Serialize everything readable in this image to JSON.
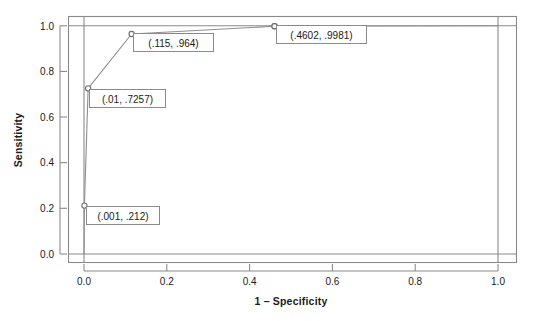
{
  "chart_data": {
    "type": "line",
    "title": "",
    "xlabel": "1 – Specificity",
    "ylabel": "Sensitivity",
    "xlim": [
      -0.045,
      1.045
    ],
    "ylim": [
      -0.04,
      1.06
    ],
    "grid": false,
    "legend": "none",
    "xticks": [
      "0.0",
      "0.2",
      "0.4",
      "0.6",
      "0.8",
      "1.0"
    ],
    "xtick_values": [
      0.0,
      0.2,
      0.4,
      0.6,
      0.8,
      1.0
    ],
    "yticks": [
      "0.0",
      "0.2",
      "0.4",
      "0.6",
      "0.8",
      "1.0"
    ],
    "ytick_values": [
      0.0,
      0.2,
      0.4,
      0.6,
      0.8,
      1.0
    ],
    "series": [
      {
        "name": "ROC curve",
        "x": [
          0.0,
          0.001,
          0.01,
          0.115,
          0.4602,
          1.0
        ],
        "y": [
          0.0,
          0.212,
          0.7257,
          0.964,
          0.9981,
          1.0
        ],
        "color": "#8f8f8f"
      }
    ],
    "annotations": [
      {
        "text": "(.001, .212)",
        "x": 0.001,
        "y": 0.212
      },
      {
        "text": "(.01, .7257)",
        "x": 0.01,
        "y": 0.7257
      },
      {
        "text": "(.115, .964)",
        "x": 0.115,
        "y": 0.964
      },
      {
        "text": "(.4602, .9981)",
        "x": 0.4602,
        "y": 0.9981
      }
    ],
    "markers": [
      {
        "x": 0.0,
        "y": 0.0
      },
      {
        "x": 0.001,
        "y": 0.212
      },
      {
        "x": 0.01,
        "y": 0.7257
      },
      {
        "x": 0.115,
        "y": 0.964
      },
      {
        "x": 0.4602,
        "y": 0.9981
      }
    ],
    "colors": {
      "line": "#8f8f8f",
      "frame": "#8a8a8a",
      "text": "#1a1a1a",
      "background": "#ffffff",
      "marker_stroke": "#6d6d6d",
      "marker_fill": "#ffffff",
      "label_box_border": "#8a8a8a",
      "label_box_fill": "#ffffff"
    }
  },
  "axes": {
    "x_title": "1 – Specificity",
    "y_title": "Sensitivity",
    "x_tick_labels": [
      "0.0",
      "0.2",
      "0.4",
      "0.6",
      "0.8",
      "1.0"
    ],
    "y_tick_labels": [
      "0.0",
      "0.2",
      "0.4",
      "0.6",
      "0.8",
      "1.0"
    ]
  },
  "point_labels": {
    "p1": "(.001, .212)",
    "p2": "(.01, .7257)",
    "p3": "(.115, .964)",
    "p4": "(.4602, .9981)"
  }
}
